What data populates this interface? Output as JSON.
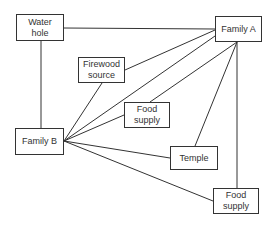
{
  "diagram": {
    "nodes": [
      {
        "id": "water_hole",
        "label": "Water\nhole",
        "x": 16,
        "y": 14,
        "w": 48,
        "h": 27
      },
      {
        "id": "family_a",
        "label": "Family A",
        "x": 215,
        "y": 16,
        "w": 47,
        "h": 26
      },
      {
        "id": "firewood_source",
        "label": "Firewood\nsource",
        "x": 78,
        "y": 57,
        "w": 47,
        "h": 26
      },
      {
        "id": "food_supply_1",
        "label": "Food\nsupply",
        "x": 124,
        "y": 102,
        "w": 46,
        "h": 26
      },
      {
        "id": "family_b",
        "label": "Family B",
        "x": 15,
        "y": 128,
        "w": 49,
        "h": 27
      },
      {
        "id": "temple",
        "label": "Temple",
        "x": 170,
        "y": 146,
        "w": 48,
        "h": 24
      },
      {
        "id": "food_supply_2",
        "label": "Food\nsupply",
        "x": 213,
        "y": 188,
        "w": 46,
        "h": 26
      }
    ],
    "labels": {
      "water_hole": "Water hole",
      "family_a": "Family A",
      "firewood_source": "Firewood source",
      "food_supply_1": "Food supply",
      "family_b": "Family B",
      "temple": "Temple",
      "food_supply_2": "Food supply"
    },
    "edges": [
      {
        "from": "water_hole",
        "to": "family_a"
      },
      {
        "from": "water_hole",
        "to": "family_b"
      },
      {
        "from": "firewood_source",
        "to": "family_a"
      },
      {
        "from": "firewood_source",
        "to": "family_b"
      },
      {
        "from": "family_b",
        "to": "family_a"
      },
      {
        "from": "family_b",
        "to": "food_supply_1"
      },
      {
        "from": "food_supply_1",
        "to": "family_a"
      },
      {
        "from": "family_b",
        "to": "temple"
      },
      {
        "from": "temple",
        "to": "family_a"
      },
      {
        "from": "family_b",
        "to": "food_supply_2"
      },
      {
        "from": "family_a",
        "to": "food_supply_2"
      }
    ]
  }
}
